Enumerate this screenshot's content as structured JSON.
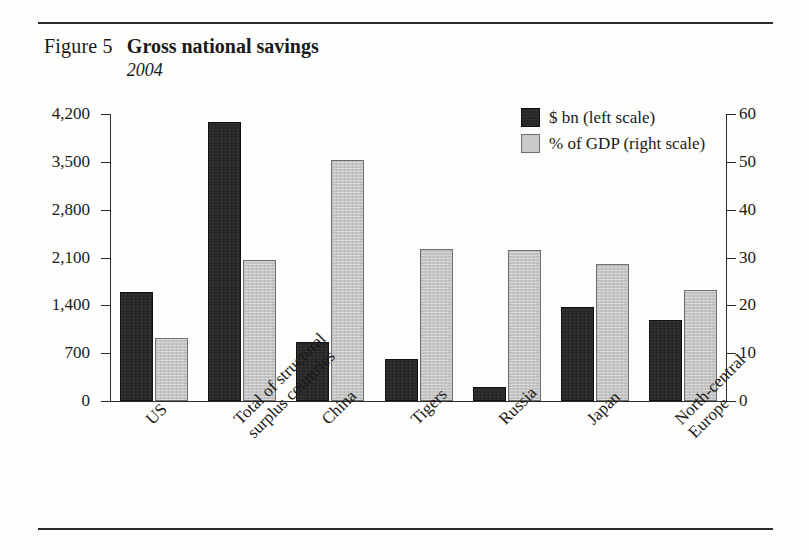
{
  "figure": {
    "number_label": "Figure 5",
    "title": "Gross national savings",
    "subtitle": "2004"
  },
  "legend": {
    "position": "top-right",
    "items": [
      {
        "label": "$ bn (left scale)",
        "swatch": "dark-square-icon",
        "color": "#262626"
      },
      {
        "label": "% of GDP (right scale)",
        "swatch": "light-square-icon",
        "color": "#c9c9c9"
      }
    ]
  },
  "axes": {
    "left": {
      "title": "$ bn",
      "ticks": [
        "0",
        "700",
        "1,400",
        "2,100",
        "2,800",
        "3,500",
        "4,200"
      ],
      "min": 0,
      "max": 4200
    },
    "right": {
      "title": "% of GDP",
      "ticks": [
        "0",
        "10",
        "20",
        "30",
        "40",
        "50",
        "60"
      ],
      "min": 0,
      "max": 60
    }
  },
  "chart_data": {
    "type": "bar",
    "title": "Gross national savings",
    "subtitle": "2004",
    "xlabel": "",
    "ylabel": "$ bn",
    "y2label": "% of GDP",
    "ylim": [
      0,
      4200
    ],
    "y2lim": [
      0,
      60
    ],
    "grid": false,
    "legend_position": "top-right",
    "categories": [
      "US",
      "Total of structural surplus countries",
      "China",
      "Tigers",
      "Russia",
      "Japan",
      "North-central Europe"
    ],
    "category_lines": [
      [
        "US"
      ],
      [
        "Total of structural",
        "surplus countries"
      ],
      [
        "China"
      ],
      [
        "Tigers"
      ],
      [
        "Russia"
      ],
      [
        "Japan"
      ],
      [
        "North-central",
        "Europe"
      ]
    ],
    "series": [
      {
        "name": "$ bn (left scale)",
        "axis": "left",
        "color": "#262626",
        "values": [
          1600,
          4080,
          860,
          620,
          200,
          1380,
          1180
        ]
      },
      {
        "name": "% of GDP (right scale)",
        "axis": "right",
        "color": "#c9c9c9",
        "values": [
          13.2,
          29.5,
          50.4,
          31.8,
          31.6,
          28.6,
          23.2
        ]
      }
    ]
  }
}
